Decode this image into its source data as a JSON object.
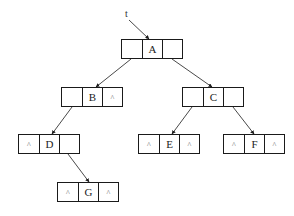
{
  "diagram": {
    "type": "binary-tree-linked-representation",
    "root_pointer_label": "t",
    "null_symbol": "^",
    "colors": {
      "line": "#1a1a1a",
      "text": "#222222",
      "background": "#ffffff"
    },
    "nodes": [
      {
        "id": "A",
        "left": "",
        "data": "A",
        "right": "",
        "x": 121,
        "y": 39
      },
      {
        "id": "B",
        "left": "",
        "data": "B",
        "right": "^",
        "x": 61,
        "y": 87
      },
      {
        "id": "C",
        "left": "",
        "data": "C",
        "right": "",
        "x": 182,
        "y": 87
      },
      {
        "id": "D",
        "left": "^",
        "data": "D",
        "right": "",
        "x": 18,
        "y": 134
      },
      {
        "id": "E",
        "left": "^",
        "data": "E",
        "right": "^",
        "x": 138,
        "y": 134
      },
      {
        "id": "F",
        "left": "^",
        "data": "F",
        "right": "^",
        "x": 223,
        "y": 134
      },
      {
        "id": "G",
        "left": "^",
        "data": "G",
        "right": "^",
        "x": 57,
        "y": 182
      }
    ],
    "edges": [
      {
        "from": "t",
        "to": "A",
        "x1": 129,
        "y1": 20,
        "x2": 149,
        "y2": 39
      },
      {
        "from": "A",
        "to": "B",
        "x1": 131,
        "y1": 59,
        "x2": 96,
        "y2": 87
      },
      {
        "from": "A",
        "to": "C",
        "x1": 172,
        "y1": 59,
        "x2": 212,
        "y2": 87
      },
      {
        "from": "B",
        "to": "D",
        "x1": 72,
        "y1": 107,
        "x2": 52,
        "y2": 134
      },
      {
        "from": "C",
        "to": "E",
        "x1": 192,
        "y1": 107,
        "x2": 172,
        "y2": 134
      },
      {
        "from": "C",
        "to": "F",
        "x1": 233,
        "y1": 107,
        "x2": 254,
        "y2": 134
      },
      {
        "from": "D",
        "to": "G",
        "x1": 68,
        "y1": 154,
        "x2": 89,
        "y2": 182
      }
    ]
  }
}
